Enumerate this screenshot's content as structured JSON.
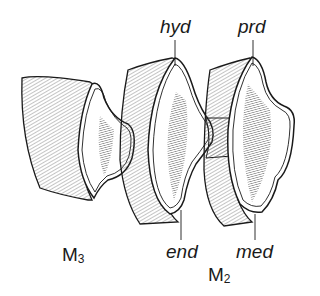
{
  "figure": {
    "colors": {
      "ink": "#1a1a1a",
      "paper": "#ffffff",
      "hatch": "#555555"
    }
  },
  "teeth": [
    {
      "id": "M3",
      "label_base": "M",
      "label_sub": "3"
    },
    {
      "id": "M2",
      "label_base": "M",
      "label_sub": "2"
    }
  ],
  "labels": {
    "hyd": "hyd",
    "prd": "prd",
    "end": "end",
    "med": "med"
  }
}
